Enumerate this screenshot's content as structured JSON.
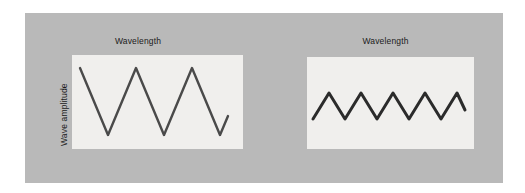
{
  "figure": {
    "background_color": "#ffffff",
    "backdrop_color": "#b9b9b9",
    "plot_background_color": "#f0efed",
    "wave_color": "#3c3c3c"
  },
  "panels": [
    {
      "name": "long-wavelength-panel",
      "top_axis_label": "Wavelength",
      "side_axis_label": "Wave amplitude",
      "wave": {
        "shape": "zigzag-rounded",
        "cycles": 2.75,
        "peaks": 3,
        "troughs": 2,
        "relative_amplitude": "large",
        "relative_wavelength": "long"
      }
    },
    {
      "name": "short-wavelength-panel",
      "top_axis_label": "Wavelength",
      "side_axis_label": "Wave amplitude",
      "wave": {
        "shape": "zigzag-rounded",
        "cycles": 4.75,
        "peaks": 5,
        "troughs": 4,
        "relative_amplitude": "small",
        "relative_wavelength": "short"
      }
    }
  ],
  "chart_data": {
    "type": "line",
    "title": "",
    "xlabel": "Wavelength",
    "ylabel": "Wave amplitude",
    "grid": false,
    "legend": "none",
    "panels": [
      {
        "name": "long-wavelength-panel",
        "xlabel": "Wavelength",
        "ylabel": "Wave amplitude",
        "xlim": [
          0,
          171
        ],
        "ylim": [
          0,
          94
        ],
        "series": [
          {
            "name": "long-wavelength-large-amplitude-wave",
            "points": [
              [
                8,
                13
              ],
              [
                36,
                80
              ],
              [
                64,
                13
              ],
              [
                92,
                80
              ],
              [
                120,
                13
              ],
              [
                148,
                80
              ],
              [
                156,
                61
              ]
            ]
          }
        ]
      },
      {
        "name": "short-wavelength-panel",
        "xlabel": "Wavelength",
        "ylabel": "Wave amplitude",
        "xlim": [
          0,
          167
        ],
        "ylim": [
          0,
          92
        ],
        "series": [
          {
            "name": "short-wavelength-small-amplitude-wave",
            "points": [
              [
                6,
                62
              ],
              [
                22,
                36
              ],
              [
                38,
                62
              ],
              [
                54,
                36
              ],
              [
                70,
                62
              ],
              [
                86,
                36
              ],
              [
                102,
                62
              ],
              [
                118,
                36
              ],
              [
                134,
                62
              ],
              [
                150,
                36
              ],
              [
                158,
                53
              ]
            ]
          }
        ]
      }
    ]
  }
}
